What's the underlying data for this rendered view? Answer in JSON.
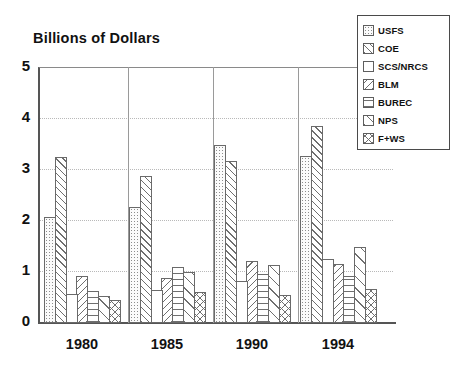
{
  "chart_data": {
    "type": "bar",
    "title": "Billions of Dollars",
    "xlabel": "",
    "ylabel": "Billions of Dollars",
    "ylim": [
      0,
      5
    ],
    "yticks": [
      "0",
      "1",
      "2",
      "3",
      "4",
      "5"
    ],
    "grid": true,
    "legend_position": "top-right",
    "categories": [
      "1980",
      "1985",
      "1990",
      "1994"
    ],
    "series": [
      {
        "name": "USFS",
        "pattern": "dots",
        "values": [
          2.07,
          2.27,
          3.5,
          3.28
        ]
      },
      {
        "name": "COE",
        "pattern": "diag-right",
        "values": [
          3.25,
          2.89,
          3.18,
          3.87
        ]
      },
      {
        "name": "SCS/NRCS",
        "pattern": "solid-white",
        "values": [
          0.56,
          0.64,
          0.82,
          1.25
        ]
      },
      {
        "name": "BLM",
        "pattern": "diag-left",
        "values": [
          0.93,
          0.88,
          1.22,
          1.16
        ]
      },
      {
        "name": "BUREC",
        "pattern": "horizontal",
        "values": [
          0.63,
          1.09,
          0.97,
          0.92
        ]
      },
      {
        "name": "NPS",
        "pattern": "diag-wide",
        "values": [
          0.52,
          1.01,
          1.14,
          1.5
        ]
      },
      {
        "name": "F+WS",
        "pattern": "crosshatch",
        "values": [
          0.45,
          0.6,
          0.55,
          0.67
        ]
      }
    ]
  },
  "legend": {
    "items": [
      {
        "label": "USFS"
      },
      {
        "label": "COE"
      },
      {
        "label": "SCS/NRCS"
      },
      {
        "label": "BLM"
      },
      {
        "label": "BUREC"
      },
      {
        "label": "NPS"
      },
      {
        "label": "F+WS"
      }
    ]
  },
  "colors": {
    "axis": "#555555",
    "grid": "#b9b9b9",
    "hatch": "#6f6f6f",
    "text": "#111111",
    "background": "#ffffff"
  }
}
